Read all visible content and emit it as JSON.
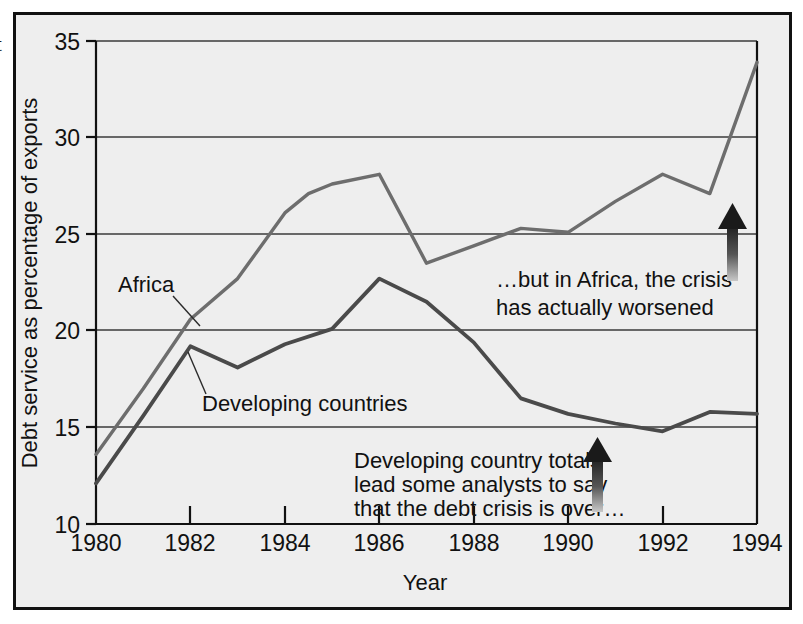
{
  "figure": {
    "cropped_left_glyph": "t",
    "background_color": "#eeeeee",
    "frame_color": "#111111"
  },
  "chart_data": {
    "type": "line",
    "title": "",
    "xlabel": "Year",
    "ylabel": "Debt service as percentage of exports",
    "x": [
      1980,
      1981,
      1982,
      1983,
      1984,
      1985,
      1986,
      1987,
      1988,
      1989,
      1990,
      1991,
      1992,
      1993,
      1994
    ],
    "xlim": [
      1980,
      1994
    ],
    "ylim": [
      10,
      35
    ],
    "xticks": [
      1980,
      1982,
      1984,
      1986,
      1988,
      1990,
      1992,
      1994
    ],
    "xtick_labels": [
      "1980",
      "1982",
      "1984",
      "1986",
      "1988",
      "1990",
      "1992",
      "1994"
    ],
    "yticks": [
      10,
      15,
      20,
      25,
      30,
      35
    ],
    "ytick_labels": [
      "10",
      "15",
      "20",
      "25",
      "30",
      "35"
    ],
    "grid": "horizontal",
    "legend_position": "inline-labels",
    "series": [
      {
        "name": "Africa",
        "color": "#6d6d6d",
        "values": [
          13.6,
          17.0,
          20.6,
          22.7,
          26.1,
          27.1,
          27.6,
          28.1,
          23.5,
          24.4,
          25.3,
          25.1,
          26.7,
          28.1,
          27.1,
          33.9
        ],
        "x": [
          1980,
          1981,
          1982,
          1983,
          1984,
          1984.5,
          1985,
          1986,
          1987,
          1988,
          1989,
          1990,
          1991,
          1992,
          1993,
          1994
        ]
      },
      {
        "name": "Developing countries",
        "color": "#4a4a4a",
        "values": [
          12.1,
          15.6,
          19.2,
          18.1,
          19.3,
          20.1,
          22.7,
          21.5,
          19.4,
          16.5,
          15.7,
          15.2,
          14.8,
          15.8,
          15.7
        ],
        "x": [
          1980,
          1981,
          1982,
          1983,
          1984,
          1985,
          1986,
          1987,
          1988,
          1989,
          1990,
          1991,
          1992,
          1993,
          1994
        ]
      }
    ],
    "annotations": [
      {
        "id": "annotation-developing",
        "lines": [
          "Developing country totals",
          "lead some analysts to say",
          "that the debt crisis is over…"
        ],
        "arrow": "up"
      },
      {
        "id": "annotation-africa",
        "lines": [
          "…but in Africa, the crisis",
          "has actually worsened"
        ],
        "arrow": "up"
      }
    ],
    "series_callouts": [
      {
        "label": "Africa",
        "target_series": "Africa"
      },
      {
        "label": "Developing countries",
        "target_series": "Developing countries"
      }
    ]
  }
}
